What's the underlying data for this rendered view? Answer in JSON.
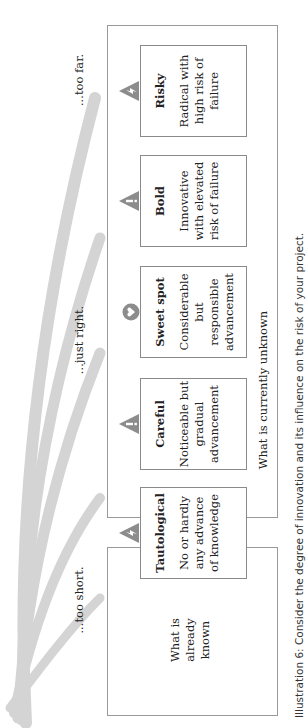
{
  "diagram": {
    "orientation": "rotated-90-ccw",
    "arrow_labels": [
      {
        "id": "too-short",
        "text": "...too short."
      },
      {
        "id": "just-right",
        "text": "...just right."
      },
      {
        "id": "too-far",
        "text": "...too far."
      }
    ],
    "regions": {
      "known": "What is already known",
      "known_lines": [
        "What is",
        "already",
        "known"
      ],
      "unknown": "What is currently unknown"
    },
    "cards": [
      {
        "title": "Tautological",
        "description_lines": [
          "No or hardly",
          "any advance",
          "of knowledge"
        ],
        "icon": "lightning-warning-icon"
      },
      {
        "title": "Careful",
        "description_lines": [
          "Noticeable but",
          "gradual",
          "advancement"
        ],
        "icon": "exclamation-warning-icon"
      },
      {
        "title": "Sweet spot",
        "description_lines": [
          "Considerable",
          "but responsible",
          "advancement"
        ],
        "icon": "heart-circle-icon"
      },
      {
        "title": "Bold",
        "description_lines": [
          "Innovative",
          "with elevated",
          "risk of failure"
        ],
        "icon": "exclamation-warning-icon"
      },
      {
        "title": "Risky",
        "description_lines": [
          "Radical with",
          "high risk of",
          "failure"
        ],
        "icon": "lightning-warning-icon"
      }
    ],
    "caption": "Illustration 6: Consider the degree of innovation and its influence on the risk of your project.",
    "colors": {
      "arrow": "#d0d0d0",
      "border": "#9a9a9a",
      "icon": "#8c8c8c"
    }
  }
}
